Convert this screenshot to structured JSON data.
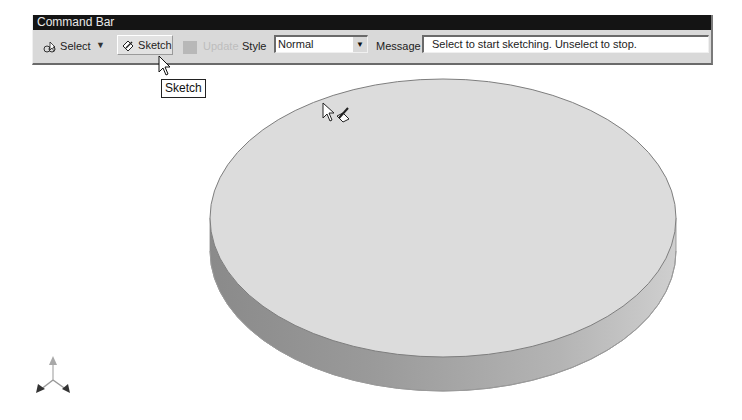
{
  "command_bar": {
    "title": "Command Bar",
    "select_label": "Select",
    "sketch_label": "Sketch",
    "update_label": "Update",
    "style_label": "Style",
    "style_value": "Normal",
    "message_label": "Message",
    "message_value": "Select to start sketching. Unselect to stop."
  },
  "tooltip": {
    "text": "Sketch"
  },
  "icons": {
    "select": "select-arrow-icon",
    "sketch": "sketch-pencil-icon",
    "update": "update-square-icon",
    "dropdown": "chevron-down-icon",
    "triad": "axis-triad-icon"
  },
  "colors": {
    "title_bar": "#141414",
    "toolbar_bg": "#d9d9d9",
    "disc_top": "#dcdcdc",
    "disc_side_dark": "#8f8f8f",
    "disc_side_light": "#c4c4c4"
  }
}
